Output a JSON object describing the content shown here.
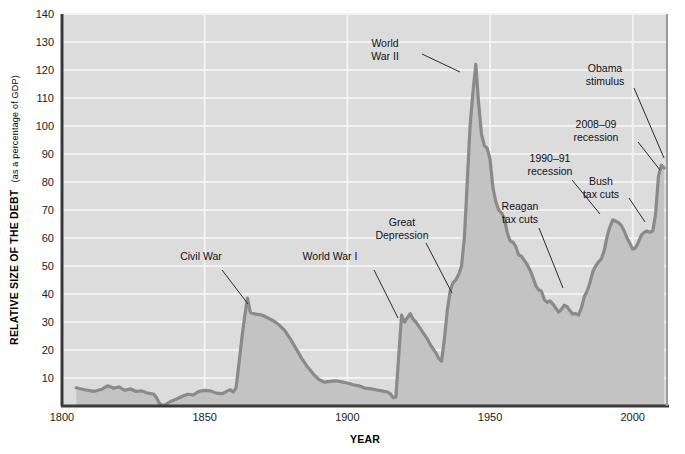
{
  "chart_data": {
    "type": "area",
    "title": "",
    "xlabel": "YEAR",
    "ylabel": "RELATIVE SIZE OF THE DEBT",
    "ylabel_sub": "(as a percentage of GDP)",
    "xlim": [
      1800,
      2012
    ],
    "ylim": [
      0,
      140
    ],
    "xticks": [
      1800,
      1850,
      1900,
      1950,
      2000
    ],
    "yticks": [
      10,
      20,
      30,
      40,
      50,
      60,
      70,
      80,
      90,
      100,
      110,
      120,
      130,
      140
    ],
    "grid": "horizontal-and-vertical",
    "legend": "none",
    "series_name": "Federal debt as percentage of GDP",
    "colors": {
      "plot_background": "#dcdcdc",
      "area_fill": "#c3c3c3",
      "line": "#8a8a8a",
      "gridline": "#f2f2f2",
      "axis": "#3a3a3a",
      "text": "#111111"
    },
    "points": [
      [
        1805,
        6.5
      ],
      [
        1808,
        5.8
      ],
      [
        1811,
        5.2
      ],
      [
        1814,
        6.0
      ],
      [
        1816,
        7.2
      ],
      [
        1818,
        6.4
      ],
      [
        1820,
        6.8
      ],
      [
        1822,
        5.6
      ],
      [
        1824,
        6.1
      ],
      [
        1826,
        5.2
      ],
      [
        1828,
        5.4
      ],
      [
        1830,
        4.6
      ],
      [
        1832,
        4.3
      ],
      [
        1833,
        3.2
      ],
      [
        1834,
        1.2
      ],
      [
        1835,
        0.3
      ],
      [
        1836,
        0.3
      ],
      [
        1838,
        1.6
      ],
      [
        1840,
        2.4
      ],
      [
        1842,
        3.4
      ],
      [
        1844,
        4.2
      ],
      [
        1846,
        4.0
      ],
      [
        1848,
        5.2
      ],
      [
        1850,
        5.6
      ],
      [
        1852,
        5.4
      ],
      [
        1854,
        4.6
      ],
      [
        1856,
        4.4
      ],
      [
        1857,
        4.8
      ],
      [
        1858,
        5.4
      ],
      [
        1859,
        5.8
      ],
      [
        1860,
        5.0
      ],
      [
        1861,
        6.5
      ],
      [
        1862,
        15.0
      ],
      [
        1863,
        24.0
      ],
      [
        1864,
        32.0
      ],
      [
        1865,
        38.5
      ],
      [
        1866,
        33.5
      ],
      [
        1867,
        33.0
      ],
      [
        1868,
        32.8
      ],
      [
        1870,
        32.5
      ],
      [
        1872,
        31.5
      ],
      [
        1874,
        30.5
      ],
      [
        1876,
        29.0
      ],
      [
        1878,
        27.0
      ],
      [
        1880,
        24.0
      ],
      [
        1882,
        20.5
      ],
      [
        1884,
        17.0
      ],
      [
        1886,
        14.0
      ],
      [
        1888,
        11.5
      ],
      [
        1890,
        9.5
      ],
      [
        1892,
        8.5
      ],
      [
        1894,
        8.8
      ],
      [
        1896,
        9.0
      ],
      [
        1898,
        8.6
      ],
      [
        1900,
        8.2
      ],
      [
        1902,
        7.6
      ],
      [
        1904,
        7.2
      ],
      [
        1906,
        6.4
      ],
      [
        1908,
        6.2
      ],
      [
        1910,
        5.8
      ],
      [
        1912,
        5.4
      ],
      [
        1914,
        5.0
      ],
      [
        1915,
        4.4
      ],
      [
        1916,
        3.0
      ],
      [
        1917,
        3.2
      ],
      [
        1918,
        18.0
      ],
      [
        1919,
        32.5
      ],
      [
        1920,
        30.0
      ],
      [
        1921,
        31.5
      ],
      [
        1922,
        33.0
      ],
      [
        1923,
        31.0
      ],
      [
        1924,
        30.0
      ],
      [
        1925,
        28.5
      ],
      [
        1926,
        27.0
      ],
      [
        1927,
        25.5
      ],
      [
        1928,
        24.0
      ],
      [
        1929,
        22.0
      ],
      [
        1930,
        20.5
      ],
      [
        1931,
        19.0
      ],
      [
        1932,
        17.0
      ],
      [
        1933,
        16.0
      ],
      [
        1934,
        24.0
      ],
      [
        1935,
        34.0
      ],
      [
        1936,
        41.0
      ],
      [
        1937,
        44.0
      ],
      [
        1938,
        45.0
      ],
      [
        1939,
        47.0
      ],
      [
        1940,
        50.0
      ],
      [
        1941,
        60.0
      ],
      [
        1942,
        80.0
      ],
      [
        1943,
        100.0
      ],
      [
        1944,
        112.0
      ],
      [
        1945,
        122.0
      ],
      [
        1946,
        108.0
      ],
      [
        1947,
        97.0
      ],
      [
        1948,
        93.0
      ],
      [
        1949,
        92.0
      ],
      [
        1950,
        88.0
      ],
      [
        1951,
        78.0
      ],
      [
        1952,
        73.0
      ],
      [
        1953,
        70.0
      ],
      [
        1954,
        69.0
      ],
      [
        1955,
        67.0
      ],
      [
        1956,
        62.0
      ],
      [
        1957,
        59.0
      ],
      [
        1958,
        58.5
      ],
      [
        1959,
        57.0
      ],
      [
        1960,
        54.0
      ],
      [
        1961,
        53.5
      ],
      [
        1962,
        52.0
      ],
      [
        1963,
        50.5
      ],
      [
        1964,
        48.5
      ],
      [
        1965,
        46.0
      ],
      [
        1966,
        43.0
      ],
      [
        1967,
        41.5
      ],
      [
        1968,
        41.0
      ],
      [
        1969,
        38.0
      ],
      [
        1970,
        37.0
      ],
      [
        1971,
        37.5
      ],
      [
        1972,
        36.5
      ],
      [
        1973,
        35.0
      ],
      [
        1974,
        33.5
      ],
      [
        1975,
        34.5
      ],
      [
        1976,
        36.0
      ],
      [
        1977,
        35.5
      ],
      [
        1978,
        34.0
      ],
      [
        1979,
        32.8
      ],
      [
        1980,
        33.0
      ],
      [
        1981,
        32.5
      ],
      [
        1982,
        35.0
      ],
      [
        1983,
        39.0
      ],
      [
        1984,
        41.0
      ],
      [
        1985,
        44.0
      ],
      [
        1986,
        48.0
      ],
      [
        1987,
        50.0
      ],
      [
        1988,
        51.5
      ],
      [
        1989,
        52.5
      ],
      [
        1990,
        55.5
      ],
      [
        1991,
        60.5
      ],
      [
        1992,
        64.0
      ],
      [
        1993,
        66.5
      ],
      [
        1994,
        66.0
      ],
      [
        1995,
        65.5
      ],
      [
        1996,
        64.5
      ],
      [
        1997,
        62.5
      ],
      [
        1998,
        60.0
      ],
      [
        1999,
        58.0
      ],
      [
        2000,
        56.0
      ],
      [
        2001,
        56.5
      ],
      [
        2002,
        58.5
      ],
      [
        2003,
        61.0
      ],
      [
        2004,
        62.0
      ],
      [
        2005,
        62.5
      ],
      [
        2006,
        62.0
      ],
      [
        2007,
        62.5
      ],
      [
        2008,
        68.5
      ],
      [
        2009,
        82.0
      ],
      [
        2010,
        86.0
      ],
      [
        2011,
        85.0
      ]
    ],
    "annotations": [
      {
        "id": "civil-war",
        "lines": [
          "Civil War"
        ],
        "text_x": 201,
        "text_y": 260,
        "anchor": "start",
        "leader": [
          [
            222,
            270
          ],
          [
            248,
            304
          ]
        ]
      },
      {
        "id": "world-war-i",
        "lines": [
          "World War I"
        ],
        "text_x": 330,
        "text_y": 260,
        "anchor": "start",
        "leader": [
          [
            374,
            270
          ],
          [
            398,
            318
          ]
        ]
      },
      {
        "id": "great-depression",
        "lines": [
          "Great",
          "Depression"
        ],
        "text_x": 402,
        "text_y": 226,
        "anchor": "start",
        "leader": [
          [
            426,
            243
          ],
          [
            452,
            293
          ]
        ]
      },
      {
        "id": "world-war-ii",
        "lines": [
          "World",
          "War II"
        ],
        "text_x": 385,
        "text_y": 47,
        "anchor": "start",
        "leader": [
          [
            422,
            54
          ],
          [
            460,
            72
          ]
        ]
      },
      {
        "id": "reagan-tax-cuts",
        "lines": [
          "Reagan",
          "tax cuts"
        ],
        "text_x": 520,
        "text_y": 210,
        "anchor": "start",
        "leader": [
          [
            539,
            228
          ],
          [
            563,
            288
          ]
        ]
      },
      {
        "id": "recession-1990-91",
        "lines": [
          "1990–91",
          "recession"
        ],
        "text_x": 550,
        "text_y": 162,
        "anchor": "start",
        "leader": [
          [
            572,
            180
          ],
          [
            600,
            214
          ]
        ]
      },
      {
        "id": "bush-tax-cuts",
        "lines": [
          "Bush",
          "tax cuts"
        ],
        "text_x": 601,
        "text_y": 185,
        "anchor": "start",
        "leader": [
          [
            629,
            198
          ],
          [
            645,
            222
          ]
        ]
      },
      {
        "id": "recession-2008-09",
        "lines": [
          "2008–09",
          "recession"
        ],
        "text_x": 596,
        "text_y": 128,
        "anchor": "start",
        "leader": [
          [
            638,
            142
          ],
          [
            660,
            170
          ]
        ]
      },
      {
        "id": "obama-stimulus",
        "lines": [
          "Obama",
          "stimulus"
        ],
        "text_x": 605,
        "text_y": 72,
        "anchor": "start",
        "leader": [
          [
            634,
            88
          ],
          [
            664,
            158
          ]
        ]
      }
    ]
  }
}
